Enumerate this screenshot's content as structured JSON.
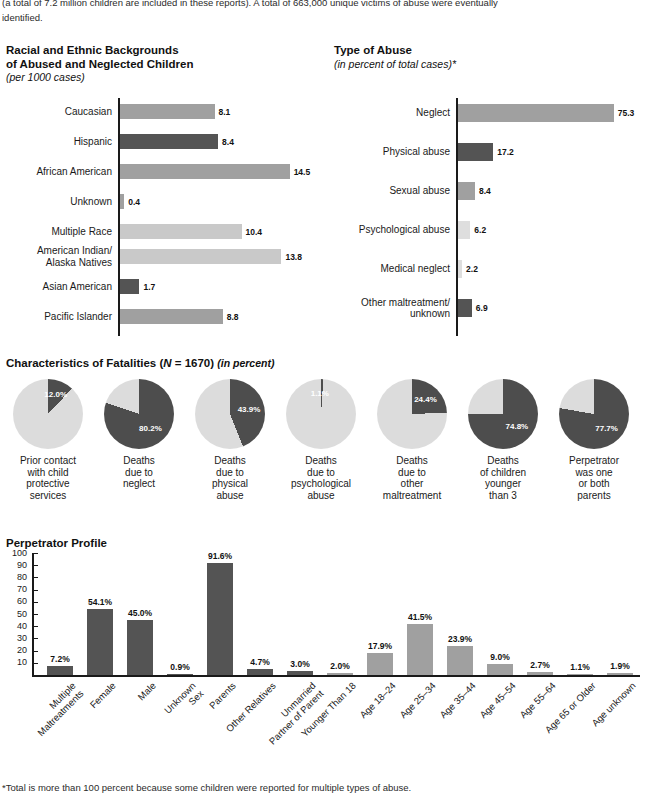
{
  "intro": {
    "line1": "(a total of 7.2 million children are included in these reports). A total of 663,000 unique victims of abuse were eventually",
    "line2": "identified."
  },
  "colors": {
    "bar_light": "#a0a0a0",
    "bar_dark": "#545454",
    "bar_xlight": "#c9c9c9",
    "bar_xxlight": "#dedede",
    "pie_light": "#dcdcdc",
    "pie_dark": "#4d4d4d",
    "axis": "#1a1a1a"
  },
  "race_chart": {
    "title_line1": "Racial and Ethnic Backgrounds",
    "title_line2": "of Abused and Neglected Children",
    "subtitle": "(per 1000 cases)",
    "chart_data": {
      "type": "bar",
      "orientation": "horizontal",
      "title": "Racial and Ethnic Backgrounds of Abused and Neglected Children",
      "ylabel": "",
      "xlabel": "per 1000 cases",
      "xlim": [
        0,
        16
      ],
      "grid": false,
      "categories": [
        "Caucasian",
        "Hispanic",
        "African American",
        "Unknown",
        "Multiple Race",
        "American Indian/\nAlaska Natives",
        "Asian American",
        "Pacific Islander"
      ],
      "values": [
        8.1,
        8.4,
        14.5,
        0.4,
        10.4,
        13.8,
        1.7,
        8.8
      ],
      "value_labels": [
        "8.1",
        "8.4",
        "14.5",
        "0.4",
        "10.4",
        "13.8",
        "1.7",
        "8.8"
      ],
      "bar_shades": [
        "light",
        "dark",
        "light",
        "light",
        "xlight",
        "xlight",
        "dark",
        "light"
      ]
    }
  },
  "abuse_chart": {
    "title": "Type of Abuse",
    "subtitle": "(in percent of total cases)*",
    "chart_data": {
      "type": "bar",
      "orientation": "horizontal",
      "title": "Type of Abuse",
      "xlabel": "in percent of total cases",
      "ylabel": "",
      "xlim": [
        0,
        80
      ],
      "grid": false,
      "categories": [
        "Neglect",
        "Physical abuse",
        "Sexual abuse",
        "Psychological abuse",
        "Medical neglect",
        "Other maltreatment/\nunknown"
      ],
      "values": [
        75.3,
        17.2,
        8.4,
        6.2,
        2.2,
        6.9
      ],
      "value_labels": [
        "75.3",
        "17.2",
        "8.4",
        "6.2",
        "2.2",
        "6.9"
      ],
      "bar_shades": [
        "light",
        "dark",
        "light",
        "xxlight",
        "xxlight",
        "dark"
      ]
    }
  },
  "fatalities": {
    "title_main": "Characteristics of Fatalities (",
    "title_n": "N",
    "title_n_val": " = 1670) ",
    "title_unit": "(in percent)",
    "chart_data": {
      "type": "pie",
      "title": "Characteristics of Fatalities (N = 1670) (in percent)",
      "unit": "percent",
      "slices": [
        {
          "label": "Prior contact\nwith child\nprotective\nservices",
          "value": 12.0,
          "value_label": "12.0%"
        },
        {
          "label": "Deaths\ndue to\nneglect",
          "value": 80.2,
          "value_label": "80.2%"
        },
        {
          "label": "Deaths\ndue to\nphysical\nabuse",
          "value": 43.9,
          "value_label": "43.9%"
        },
        {
          "label": "Deaths\ndue to\npsychological\nabuse",
          "value": 1.1,
          "value_label": "1.1%"
        },
        {
          "label": "Deaths\ndue to\nother\nmaltreatment",
          "value": 24.4,
          "value_label": "24.4%"
        },
        {
          "label": "Deaths\nof children\nyounger\nthan 3",
          "value": 74.8,
          "value_label": "74.8%"
        },
        {
          "label": "Perpetrator\nwas one\nor both\nparents",
          "value": 77.7,
          "value_label": "77.7%"
        }
      ]
    }
  },
  "perpetrator": {
    "title": "Perpetrator Profile",
    "chart_data": {
      "type": "bar",
      "orientation": "vertical",
      "title": "Perpetrator Profile",
      "xlabel": "",
      "ylabel": "",
      "ylim": [
        0,
        100
      ],
      "yticks": [
        100,
        90,
        80,
        70,
        60,
        50,
        40,
        30,
        20,
        10
      ],
      "grid": false,
      "categories": [
        "Multiple\nMaltreatments",
        "Female",
        "Male",
        "Unknown\nSex",
        "Parents",
        "Other Relatives",
        "Unmarried\nPartner of Parent",
        "Younger Than 18",
        "Age 18–24",
        "Age 25–34",
        "Age 35–44",
        "Age 45–54",
        "Age 55–64",
        "Age 65 or Older",
        "Age unknown"
      ],
      "values": [
        7.2,
        54.1,
        45.0,
        0.9,
        91.6,
        4.7,
        3.0,
        2.0,
        17.9,
        41.5,
        23.9,
        9.0,
        2.7,
        1.1,
        1.9
      ],
      "value_labels": [
        "7.2%",
        "54.1%",
        "45.0%",
        "0.9%",
        "91.6%",
        "4.7%",
        "3.0%",
        "2.0%",
        "17.9%",
        "41.5%",
        "23.9%",
        "9.0%",
        "2.7%",
        "1.1%",
        "1.9%"
      ],
      "bar_shades": [
        "dark",
        "dark",
        "dark",
        "dark",
        "dark",
        "dark",
        "dark",
        "light",
        "light",
        "light",
        "light",
        "light",
        "light",
        "light",
        "light"
      ]
    }
  },
  "footnote": "*Total is more than 100 percent because some children were reported for multiple types of abuse."
}
